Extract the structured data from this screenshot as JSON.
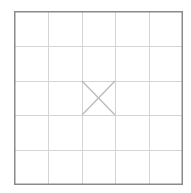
{
  "board": {
    "rows": 5,
    "cols": 5,
    "marked_cells": [
      {
        "row": 2,
        "col": 2,
        "mark": "x"
      }
    ],
    "colors": {
      "border": "#8a8a8a",
      "grid": "#d4d4d4",
      "mark": "#b8b8b8",
      "background": "#ffffff"
    }
  }
}
